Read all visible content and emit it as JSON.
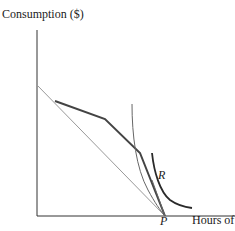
{
  "diagram": {
    "y_axis_label": "Consumption ($)",
    "x_axis_label": "Hours of",
    "point_label": "P",
    "curve_label": "R",
    "colors": {
      "axis": "#333333",
      "thin_line": "#999999",
      "thick_line": "#444444",
      "curve_thin": "#666666",
      "curve_R": "#2a2a2a"
    }
  }
}
